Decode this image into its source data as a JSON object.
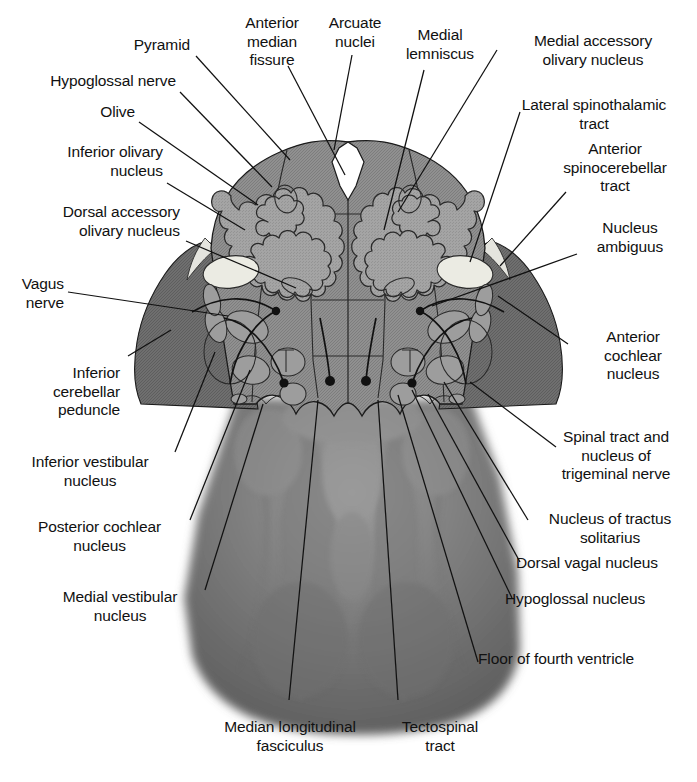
{
  "figure": {
    "kind": "labeled-anatomical-diagram",
    "colors": {
      "background": "#ffffff",
      "tegmentum_gray": "#8d8d8d",
      "peduncle_dark": "#6e6e6e",
      "cerebellum_dark": "#6a6a6a",
      "pale_nucleus": "#e9e9e1",
      "olivary_ribbon": "#a6a6a6",
      "outline": "#1a1a1a",
      "label_text": "#111111"
    }
  },
  "labels": {
    "pyramid": "Pyramid",
    "hypoglossal_nerve": "Hypoglossal nerve",
    "olive": "Olive",
    "inferior_olivary_nucleus": "Inferior olivary\nnucleus",
    "dorsal_accessory_olivary_nucleus": "Dorsal accessory\nolivary nucleus",
    "vagus_nerve": "Vagus\nnerve",
    "inferior_cerebellar_peduncle": "Inferior\ncerebellar\npeduncle",
    "inferior_vestibular_nucleus": "Inferior vestibular\nnucleus",
    "posterior_cochlear_nucleus": "Posterior cochlear\nnucleus",
    "medial_vestibular_nucleus": "Medial vestibular\nnucleus",
    "anterior_median_fissure": "Anterior\nmedian\nfissure",
    "arcuate_nuclei": "Arcuate\nnuclei",
    "medial_lemniscus": "Medial\nlemniscus",
    "medial_accessory_olivary_nucleus": "Medial accessory\nolivary nucleus",
    "lateral_spinothalamic_tract": "Lateral spinothalamic\ntract",
    "anterior_spinocerebellar_tract": "Anterior\nspinocerebellar\ntract",
    "nucleus_ambiguus": "Nucleus\nambiguus",
    "anterior_cochlear_nucleus": "Anterior\ncochlear\nnucleus",
    "spinal_tract_trigeminal": "Spinal tract and\nnucleus of\ntrigeminal nerve",
    "nucleus_tractus_solitarius": "Nucleus of tractus\nsolitarius",
    "dorsal_vagal_nucleus": "Dorsal vagal nucleus",
    "hypoglossal_nucleus": "Hypoglossal nucleus",
    "floor_of_fourth_ventricle": "Floor of fourth ventricle",
    "median_longitudinal_fasciculus": "Median longitudinal\nfasciculus",
    "tectospinal_tract": "Tectospinal\ntract"
  }
}
